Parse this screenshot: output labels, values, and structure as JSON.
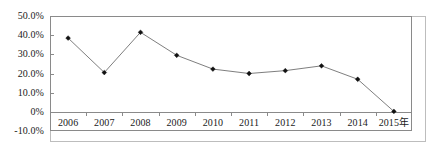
{
  "chart_data": {
    "type": "line",
    "title": "",
    "subtitle": "",
    "xlabel": "",
    "ylabel": "",
    "categories": [
      "2006",
      "2007",
      "2008",
      "2009",
      "2010",
      "2011",
      "2012",
      "2013",
      "2014",
      "2015"
    ],
    "x_tick_labels": [
      "2006",
      "2007",
      "2008",
      "2009",
      "2010",
      "2011",
      "2012",
      "2013",
      "2014",
      "2015年"
    ],
    "values": [
      38.5,
      20.5,
      41.5,
      29.5,
      22.3,
      20.0,
      21.5,
      24.0,
      17.0,
      0.2
    ],
    "value_labels": [
      "38.5%",
      "20.5%",
      "41.5%",
      "29.5%",
      "22.3%",
      "20.0%",
      "21.5%",
      "24.0%",
      "17.0%",
      "0.2%"
    ],
    "y_tick_labels": [
      "50.0%",
      "40.0%",
      "30.0%",
      "20.0%",
      "10.0%",
      "0%",
      "-10.0%"
    ],
    "y_tick_values": [
      50.0,
      40.0,
      30.0,
      20.0,
      10.0,
      0.0,
      -10.0
    ],
    "ylim": [
      -10.0,
      50.0
    ],
    "unit": "%",
    "grid": false,
    "legend": null,
    "legend_position": "none",
    "marker": "diamond",
    "line_color": "#6f6f6f",
    "marker_color": "#111111",
    "axis_color": "#8a8a8a",
    "background_color": "#ffffff",
    "annotations": []
  }
}
